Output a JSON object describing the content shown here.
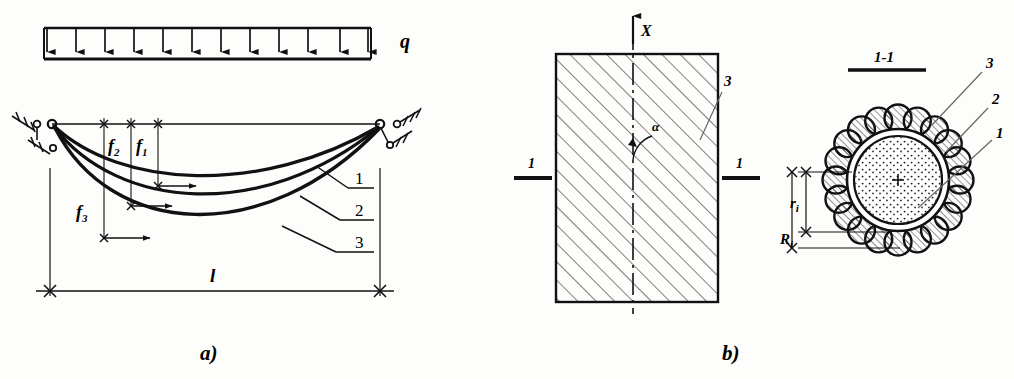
{
  "figure": {
    "background": "#fdfdfb",
    "ink": "#1a1a1a",
    "captions": {
      "part_a": "a)",
      "part_b": "b)"
    }
  },
  "part_a": {
    "name": "cable-sag-diagram",
    "load": {
      "symbol": "q",
      "label": "q",
      "arrow_count": 11,
      "description": "uniformly distributed downward load"
    },
    "sag_labels": [
      {
        "id": "f1",
        "text": "f",
        "sub": "1"
      },
      {
        "id": "f2",
        "text": "f",
        "sub": "2"
      },
      {
        "id": "f3",
        "text": "f",
        "sub": "3"
      }
    ],
    "span_label": {
      "text": "l"
    },
    "curve_callouts": [
      {
        "id": "callout-1",
        "label": "1"
      },
      {
        "id": "callout-2",
        "label": "2"
      },
      {
        "id": "callout-3",
        "label": "3"
      }
    ],
    "supports": {
      "left": "pinned-anchor",
      "right": "pinned-anchor"
    }
  },
  "part_b": {
    "name": "cross-section-diagram",
    "rect_section": {
      "axis_label": "X",
      "angle_label": "α",
      "hatch_callout": "3",
      "section_mark_left": "1",
      "section_mark_right": "1"
    },
    "detail": {
      "section_title": "1-1",
      "callouts": [
        {
          "id": "detail-callout-3",
          "label": "3",
          "meaning": "outer strand layer"
        },
        {
          "id": "detail-callout-2",
          "label": "2",
          "meaning": "sheath ring"
        },
        {
          "id": "detail-callout-1",
          "label": "1",
          "meaning": "core"
        }
      ],
      "dimensions": [
        {
          "id": "r",
          "text": "r",
          "sub": "i"
        },
        {
          "id": "R",
          "text": "R",
          "sub": "i"
        }
      ],
      "outer_strand_count": 20
    }
  }
}
